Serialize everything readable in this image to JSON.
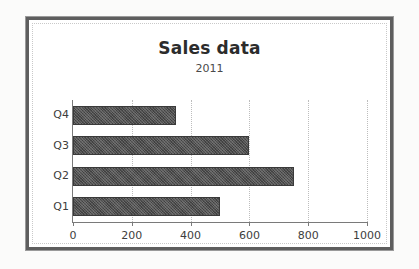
{
  "chart_data": {
    "type": "bar",
    "orientation": "horizontal",
    "title": "Sales data",
    "subtitle": "2011",
    "xlabel": "",
    "ylabel": "",
    "categories": [
      "Q1",
      "Q2",
      "Q3",
      "Q4"
    ],
    "values": [
      500,
      750,
      600,
      350
    ],
    "category_order_top_to_bottom": [
      "Q4",
      "Q3",
      "Q2",
      "Q1"
    ],
    "xlim": [
      0,
      1000
    ],
    "xticks": [
      0,
      200,
      400,
      600,
      800,
      1000
    ],
    "xtick_labels": [
      "0",
      "200",
      "400",
      "600",
      "800",
      "1000"
    ],
    "grid": "vertical-dotted",
    "legend": "none",
    "bar_color": "#4f4f4f",
    "axis_color": "#7a7a7a",
    "gridline_color": "#bdbdbd",
    "frame_color": "#5e5e5e",
    "background_color": "#ffffff"
  }
}
